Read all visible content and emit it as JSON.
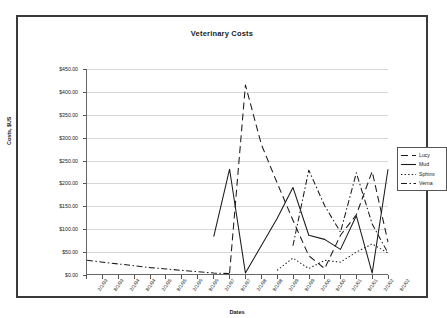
{
  "chart_data": {
    "type": "line",
    "title": "Veterinary Costs",
    "xlabel": "Dates",
    "ylabel": "Costs, $US",
    "ylim": [
      0,
      450
    ],
    "ytick_step": 50,
    "grid": true,
    "legend_position": "right",
    "ytick_labels": [
      "$0.00",
      "$50.00",
      "$100.00",
      "$150.00",
      "$200.00",
      "$250.00",
      "$300.00",
      "$350.00",
      "$400.00",
      "$450.00"
    ],
    "categories": [
      "2/1/93",
      "8/1/93",
      "2/1/94",
      "8/1/94",
      "2/1/95",
      "8/1/95",
      "2/1/96",
      "8/1/96",
      "2/1/97",
      "8/1/97",
      "2/1/98",
      "8/1/98",
      "2/1/99",
      "8/1/99",
      "2/1/00",
      "8/1/00",
      "2/1/01",
      "8/1/01",
      "2/1/02",
      "8/1/02"
    ],
    "series": [
      {
        "name": "Lucy",
        "dash": "long-dash",
        "values": [
          null,
          null,
          null,
          null,
          null,
          null,
          null,
          null,
          null,
          2,
          415,
          285,
          200,
          118,
          40,
          12,
          85,
          130,
          225,
          70
        ]
      },
      {
        "name": "Mud",
        "dash": "solid",
        "values": [
          null,
          null,
          null,
          null,
          null,
          null,
          null,
          null,
          82,
          230,
          2,
          62,
          122,
          190,
          85,
          76,
          54,
          128,
          2,
          230
        ]
      },
      {
        "name": "Sphinx",
        "dash": "dotted",
        "values": [
          null,
          null,
          null,
          null,
          null,
          null,
          null,
          null,
          null,
          null,
          null,
          null,
          8,
          35,
          12,
          30,
          26,
          48,
          66,
          46
        ]
      },
      {
        "name": "Verna",
        "dash": "dash-dot",
        "values": [
          30,
          26,
          22,
          18,
          14,
          11,
          8,
          5,
          2,
          1,
          null,
          null,
          null,
          62,
          228,
          150,
          92,
          222,
          110,
          46
        ]
      }
    ]
  },
  "legend": {
    "items": [
      {
        "label": "Lucy"
      },
      {
        "label": "Mud"
      },
      {
        "label": "Sphinx"
      },
      {
        "label": "Verna"
      }
    ]
  },
  "colors": {
    "series_line": "#1a1a1a",
    "gridline": "#d8d8d8",
    "axis": "#555555",
    "frame": "#3a3a3a",
    "text": "#1a1a1a"
  }
}
